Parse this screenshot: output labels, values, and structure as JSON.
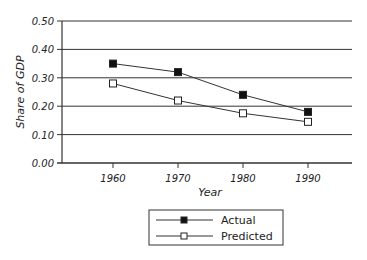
{
  "chart_data": {
    "type": "line",
    "title": "",
    "xlabel": "Year",
    "ylabel": "Share of GDP",
    "x": [
      1960,
      1970,
      1980,
      1990
    ],
    "x_tick_labels": [
      "1960",
      "1970",
      "1980",
      "1990"
    ],
    "y_tick_labels": [
      "0.00",
      "0.10",
      "0.20",
      "0.30",
      "0.40",
      "0.50"
    ],
    "ylim": [
      0.0,
      0.5
    ],
    "grid": "horizontal",
    "legend_position": "bottom-center",
    "series": [
      {
        "name": "Actual",
        "marker": "filled-square",
        "values": [
          0.35,
          0.32,
          0.24,
          0.18
        ]
      },
      {
        "name": "Predicted",
        "marker": "open-square",
        "values": [
          0.28,
          0.22,
          0.175,
          0.145
        ]
      }
    ]
  },
  "legend": {
    "items": [
      "Actual",
      "Predicted"
    ]
  }
}
